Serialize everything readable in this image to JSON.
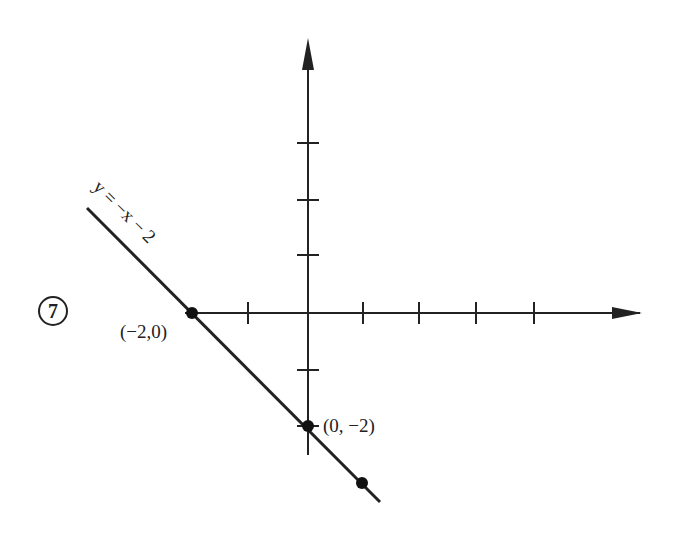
{
  "problem_number": "7",
  "equation_label": "y = −x − 2",
  "points": [
    {
      "label": "(−2,0)",
      "x": -2,
      "y": 0
    },
    {
      "label": "(0, −2)",
      "x": 0,
      "y": -2
    },
    {
      "label": "",
      "x": 1,
      "y": -3
    }
  ],
  "axes": {
    "x_ticks": [
      -2,
      -1,
      1,
      2,
      3,
      4
    ],
    "y_ticks": [
      3,
      2,
      1,
      -1,
      -2
    ]
  },
  "colors": {
    "ink": "#222222",
    "background": "#ffffff"
  }
}
